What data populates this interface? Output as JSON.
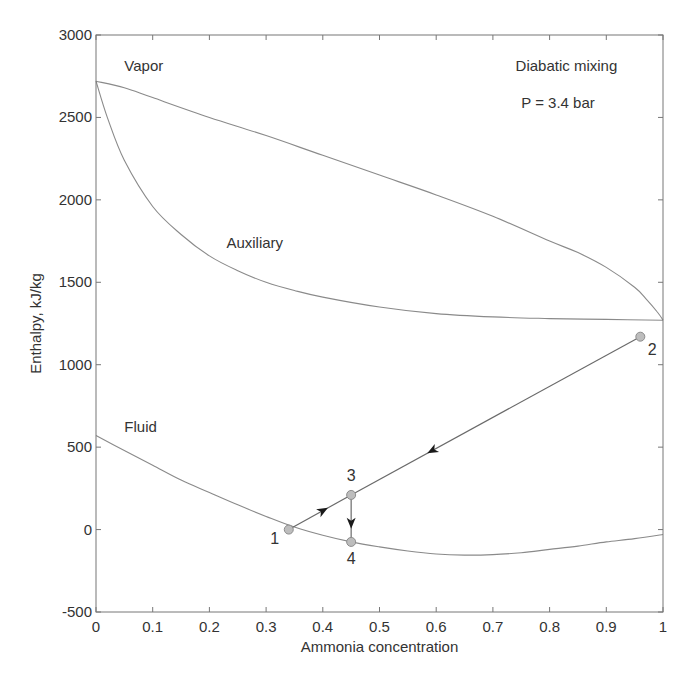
{
  "chart_data": {
    "type": "line",
    "title": "",
    "annotations": [
      {
        "text": "Diabatic mixing",
        "x": 0.74,
        "y": 2780
      },
      {
        "text": "P = 3.4 bar",
        "x": 0.75,
        "y": 2560
      }
    ],
    "xlabel": "Ammonia concentration",
    "ylabel": "Enthalpy, kJ/kg",
    "xlim": [
      0,
      1
    ],
    "ylim": [
      -500,
      3000
    ],
    "xticks": [
      0,
      0.1,
      0.2,
      0.3,
      0.4,
      0.5,
      0.6,
      0.7,
      0.8,
      0.9,
      1
    ],
    "xtick_labels": [
      "0",
      "0.1",
      "0.2",
      "0.3",
      "0.4",
      "0.5",
      "0.6",
      "0.7",
      "0.8",
      "0.9",
      "1"
    ],
    "yticks": [
      -500,
      0,
      500,
      1000,
      1500,
      2000,
      2500,
      3000
    ],
    "ytick_labels": [
      "-500",
      "0",
      "500",
      "1000",
      "1500",
      "2000",
      "2500",
      "3000"
    ],
    "grid": false,
    "legend": "none",
    "series": [
      {
        "name": "Vapor",
        "label_pos": {
          "x": 0.05,
          "y": 2780
        },
        "x": [
          0,
          0.05,
          0.1,
          0.2,
          0.3,
          0.4,
          0.5,
          0.6,
          0.7,
          0.8,
          0.85,
          0.9,
          0.95,
          0.97,
          0.99,
          1.0
        ],
        "y": [
          2720,
          2680,
          2620,
          2500,
          2390,
          2270,
          2150,
          2030,
          1900,
          1750,
          1680,
          1590,
          1470,
          1400,
          1320,
          1270
        ]
      },
      {
        "name": "Auxiliary",
        "label_pos": {
          "x": 0.23,
          "y": 1710
        },
        "x": [
          0,
          0.02,
          0.05,
          0.1,
          0.15,
          0.2,
          0.25,
          0.3,
          0.35,
          0.4,
          0.5,
          0.6,
          0.7,
          0.8,
          0.9,
          1.0
        ],
        "y": [
          2720,
          2500,
          2240,
          1960,
          1790,
          1660,
          1570,
          1500,
          1450,
          1410,
          1350,
          1310,
          1290,
          1280,
          1275,
          1270
        ]
      },
      {
        "name": "Fluid",
        "label_pos": {
          "x": 0.05,
          "y": 590
        },
        "x": [
          0,
          0.05,
          0.1,
          0.15,
          0.2,
          0.25,
          0.3,
          0.35,
          0.4,
          0.45,
          0.5,
          0.55,
          0.6,
          0.65,
          0.7,
          0.75,
          0.8,
          0.85,
          0.9,
          0.95,
          1.0
        ],
        "y": [
          570,
          480,
          390,
          300,
          225,
          150,
          80,
          15,
          -35,
          -75,
          -105,
          -130,
          -148,
          -155,
          -152,
          -140,
          -120,
          -100,
          -75,
          -55,
          -30
        ]
      }
    ],
    "process_points": [
      {
        "label": "1",
        "x": 0.34,
        "y": 0,
        "label_offset": [
          -14,
          14
        ]
      },
      {
        "label": "2",
        "x": 0.96,
        "y": 1170,
        "label_offset": [
          12,
          18
        ]
      },
      {
        "label": "3",
        "x": 0.45,
        "y": 210,
        "label_offset": [
          0,
          -14
        ]
      },
      {
        "label": "4",
        "x": 0.45,
        "y": -75,
        "label_offset": [
          0,
          22
        ]
      }
    ],
    "process_lines": [
      {
        "from": "2",
        "to": "3",
        "arrow_at": 0.72,
        "direction": "toward 3"
      },
      {
        "from": "1",
        "to": "3",
        "arrow_at": 0.55,
        "direction": "toward 3"
      },
      {
        "from": "3",
        "to": "4",
        "arrow_at": 0.6,
        "direction": "toward 4"
      }
    ]
  }
}
